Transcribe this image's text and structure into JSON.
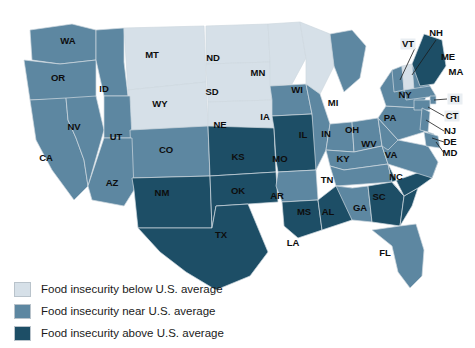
{
  "chart_data": {
    "type": "map",
    "title": "",
    "map_scope": "United States (contiguous 48 states)",
    "value_type": "categorical",
    "categories": [
      {
        "key": "below",
        "label": "Food insecurity below U.S. average",
        "color": "#d6e0e8"
      },
      {
        "key": "near",
        "label": "Food insecurity near U.S. average",
        "color": "#5d87a1"
      },
      {
        "key": "above",
        "label": "Food insecurity above U.S. average",
        "color": "#1d4e66"
      }
    ],
    "regions": [
      {
        "code": "WA",
        "category": "near"
      },
      {
        "code": "OR",
        "category": "near"
      },
      {
        "code": "ID",
        "category": "near"
      },
      {
        "code": "MT",
        "category": "below"
      },
      {
        "code": "WY",
        "category": "below"
      },
      {
        "code": "ND",
        "category": "below"
      },
      {
        "code": "SD",
        "category": "below"
      },
      {
        "code": "MN",
        "category": "below"
      },
      {
        "code": "WI",
        "category": "below"
      },
      {
        "code": "NE",
        "category": "below"
      },
      {
        "code": "NH",
        "category": "below"
      },
      {
        "code": "NV",
        "category": "near"
      },
      {
        "code": "UT",
        "category": "near"
      },
      {
        "code": "CA",
        "category": "near"
      },
      {
        "code": "AZ",
        "category": "near"
      },
      {
        "code": "CO",
        "category": "near"
      },
      {
        "code": "IA",
        "category": "near"
      },
      {
        "code": "IL",
        "category": "near"
      },
      {
        "code": "IN",
        "category": "near"
      },
      {
        "code": "MI",
        "category": "near"
      },
      {
        "code": "OH",
        "category": "near"
      },
      {
        "code": "KY",
        "category": "near"
      },
      {
        "code": "WV",
        "category": "near"
      },
      {
        "code": "VA",
        "category": "near"
      },
      {
        "code": "PA",
        "category": "near"
      },
      {
        "code": "NY",
        "category": "near"
      },
      {
        "code": "VT",
        "category": "near"
      },
      {
        "code": "MA",
        "category": "near"
      },
      {
        "code": "RI",
        "category": "near"
      },
      {
        "code": "CT",
        "category": "near"
      },
      {
        "code": "NJ",
        "category": "near"
      },
      {
        "code": "DE",
        "category": "near"
      },
      {
        "code": "MD",
        "category": "near"
      },
      {
        "code": "TN",
        "category": "near"
      },
      {
        "code": "AL",
        "category": "near"
      },
      {
        "code": "AR",
        "category": "near"
      },
      {
        "code": "FL",
        "category": "near"
      },
      {
        "code": "SC",
        "category": "above"
      },
      {
        "code": "NC",
        "category": "above"
      },
      {
        "code": "GA",
        "category": "above"
      },
      {
        "code": "MS",
        "category": "above"
      },
      {
        "code": "LA",
        "category": "above"
      },
      {
        "code": "TX",
        "category": "above"
      },
      {
        "code": "OK",
        "category": "above"
      },
      {
        "code": "KS",
        "category": "above"
      },
      {
        "code": "MO",
        "category": "above"
      },
      {
        "code": "NM",
        "category": "above"
      },
      {
        "code": "ME",
        "category": "above"
      }
    ]
  },
  "legend": {
    "items": [
      {
        "label": "Food insecurity below U.S. average",
        "color": "#d6e0e8"
      },
      {
        "label": "Food insecurity near U.S. average",
        "color": "#5d87a1"
      },
      {
        "label": "Food insecurity above U.S. average",
        "color": "#1d4e66"
      }
    ]
  },
  "state_labels": {
    "WA": "WA",
    "OR": "OR",
    "ID": "ID",
    "MT": "MT",
    "WY": "WY",
    "ND": "ND",
    "SD": "SD",
    "MN": "MN",
    "WI": "WI",
    "NE": "NE",
    "NV": "NV",
    "UT": "UT",
    "CA": "CA",
    "AZ": "AZ",
    "CO": "CO",
    "IA": "IA",
    "IL": "IL",
    "IN": "IN",
    "MI": "MI",
    "OH": "OH",
    "KY": "KY",
    "WV": "WV",
    "VA": "VA",
    "PA": "PA",
    "NY": "NY",
    "VT": "VT",
    "NH": "NH",
    "ME": "ME",
    "MA": "MA",
    "RI": "RI",
    "CT": "CT",
    "NJ": "NJ",
    "DE": "DE",
    "MD": "MD",
    "TN": "TN",
    "AL": "AL",
    "AR": "AR",
    "FL": "FL",
    "SC": "SC",
    "NC": "NC",
    "GA": "GA",
    "MS": "MS",
    "LA": "LA",
    "TX": "TX",
    "OK": "OK",
    "KS": "KS",
    "MO": "MO",
    "NM": "NM"
  }
}
